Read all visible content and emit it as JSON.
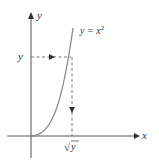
{
  "diagram": {
    "type": "function-graph",
    "axes": {
      "x_label": "x",
      "y_label": "y"
    },
    "curve": {
      "label_lhs": "y = x",
      "label_exponent": "2",
      "equation": "y = x^2",
      "color": "#8a8a8a"
    },
    "guides": {
      "horizontal_label": "y",
      "vertical_label_radical": "√",
      "vertical_label_var": "y",
      "sqrt_label": "√y",
      "line_style": "dashed"
    },
    "colors": {
      "axis": "#555555",
      "curve": "#8a8a8a",
      "dashed": "#666666",
      "text": "#333333",
      "background": "#ffffff"
    }
  }
}
